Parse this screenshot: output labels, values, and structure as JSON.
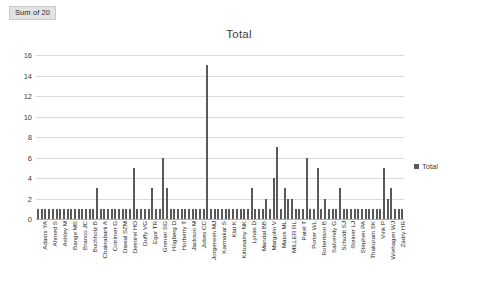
{
  "pivot": {
    "field_button_label": "Sum of 20"
  },
  "chart": {
    "title": "Total",
    "legend": [
      {
        "label": "Total",
        "color": "#595959"
      }
    ]
  },
  "axis": {
    "y_ticks": [
      "0",
      "2",
      "4",
      "6",
      "8",
      "10",
      "12",
      "14",
      "16"
    ]
  },
  "chart_data": {
    "type": "bar",
    "title": "Total",
    "xlabel": "",
    "ylabel": "",
    "ylim": [
      0,
      16
    ],
    "ytick_step": 2,
    "grid": true,
    "legend_position": "right",
    "series_name": "Total",
    "bar_color": "#595959",
    "categories": [
      "Adams YA",
      "Ahmed S",
      "Ashley M",
      "Bange MS",
      "Branco JC",
      "Buchholz B",
      "Chakrabarti A",
      "Cotrimer G",
      "Dawal SZM",
      "Demirel HO",
      "Duffy VG",
      "Egor TR",
      "Grenier SG",
      "Högberg D",
      "Horberry T",
      "Jackson M",
      "Jobes CC",
      "Jorgensen MJ",
      "Karmakar S",
      "Klat K",
      "Kittusamy NK",
      "Lynas D",
      "Mandal BB",
      "Margolin V",
      "Matos ML",
      "MILLER RL",
      "Patel T",
      "Porter WL",
      "Robertson B",
      "Salvendy G",
      "Schuldt SJ",
      "Steiner LJ",
      "Stephen PA",
      "Thakuram SK",
      "Vink P",
      "Wiehagen WJ",
      "Zadry HR"
    ],
    "values": [
      1,
      1,
      1,
      2,
      1,
      1,
      1,
      1,
      1,
      1,
      1,
      1,
      1,
      1,
      1,
      1,
      1,
      1,
      1,
      1,
      1,
      1,
      1,
      1,
      1,
      1,
      1,
      1,
      1,
      1,
      1,
      1,
      1,
      1,
      1,
      1,
      1
    ],
    "bars": [
      1,
      1,
      1,
      1,
      1,
      1,
      1,
      1,
      1,
      1,
      1,
      1,
      1,
      1,
      1,
      1,
      3,
      1,
      1,
      1,
      1,
      1,
      1,
      1,
      1,
      1,
      5,
      1,
      1,
      1,
      1,
      3,
      1,
      1,
      6,
      3,
      1,
      1,
      1,
      1,
      1,
      1,
      1,
      1,
      1,
      1,
      15,
      1,
      1,
      1,
      1,
      1,
      1,
      1,
      1,
      1,
      1,
      1,
      3,
      1,
      1,
      1,
      2,
      1,
      4,
      7,
      1,
      3,
      2,
      2,
      1,
      1,
      1,
      6,
      1,
      1,
      5,
      1,
      2,
      1,
      1,
      1,
      3,
      1,
      1,
      1,
      1,
      1,
      1,
      1,
      1,
      1,
      1,
      1,
      5,
      2,
      3,
      1,
      1,
      1
    ],
    "max_value": 15,
    "baseline_value": 1
  }
}
